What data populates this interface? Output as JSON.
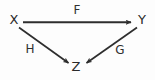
{
  "figure": {
    "kind": "commutative-diagram",
    "background_color": "#fdfdfd",
    "stroke_color": "#2e2e2e",
    "text_color": "#2a2a2a"
  },
  "nodes": [
    {
      "id": "x",
      "label": "X",
      "x": 14,
      "y": 20
    },
    {
      "id": "y",
      "label": "Y",
      "x": 142,
      "y": 20
    },
    {
      "id": "z",
      "label": "Z",
      "x": 76,
      "y": 67
    }
  ],
  "edges": [
    {
      "id": "f",
      "label": "F",
      "from": "X",
      "to": "Y",
      "direction": "right",
      "label_x": 77,
      "label_y": 10,
      "start": [
        23,
        22
      ],
      "end": [
        133,
        22
      ]
    },
    {
      "id": "h",
      "label": "H",
      "from": "X",
      "to": "Z",
      "direction": "down-right",
      "label_x": 30,
      "label_y": 49,
      "start": [
        19,
        27
      ],
      "end": [
        70,
        64
      ]
    },
    {
      "id": "g",
      "label": "G",
      "from": "Y",
      "to": "Z",
      "direction": "down-left",
      "label_x": 120,
      "label_y": 50,
      "start": [
        137,
        27
      ],
      "end": [
        85,
        64
      ]
    }
  ]
}
